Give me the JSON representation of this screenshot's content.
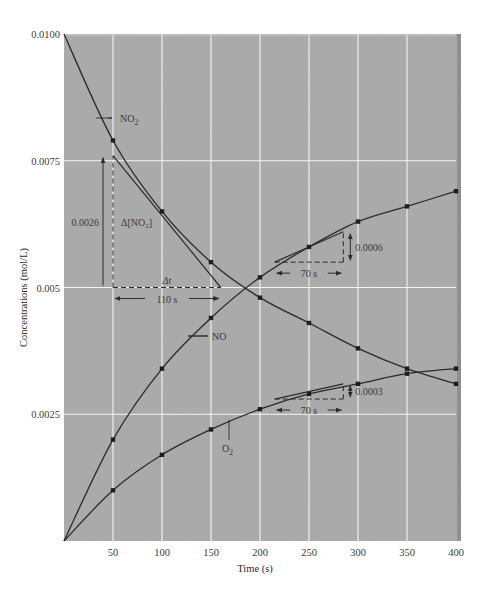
{
  "chart_data": {
    "type": "line",
    "title": "",
    "xlabel": "Time (s)",
    "ylabel": "Concentrations (mol/L)",
    "xlim": [
      0,
      400
    ],
    "ylim": [
      0,
      0.01
    ],
    "x_ticks": [
      50,
      100,
      150,
      200,
      250,
      300,
      350,
      400
    ],
    "x_tick_labels": [
      "50",
      "100",
      "150",
      "200",
      "250",
      "300",
      "350",
      "400"
    ],
    "y_ticks": [
      0.0025,
      0.005,
      0.0075,
      0.01
    ],
    "y_tick_labels": [
      "0.0025",
      "0.005",
      "0.0075",
      "0.0100"
    ],
    "grid": true,
    "legend": "inline labels",
    "x": [
      0,
      50,
      100,
      150,
      200,
      250,
      300,
      350,
      400
    ],
    "series": [
      {
        "name": "NO2",
        "label": "NO",
        "label_sub": "2",
        "values": [
          0.01,
          0.0079,
          0.0065,
          0.0055,
          0.0048,
          0.0043,
          0.0038,
          0.0034,
          0.0031
        ]
      },
      {
        "name": "NO",
        "label": "NO",
        "label_sub": "",
        "values": [
          0.0,
          0.002,
          0.0034,
          0.0044,
          0.0052,
          0.0058,
          0.0063,
          0.0066,
          0.0069
        ]
      },
      {
        "name": "O2",
        "label": "O",
        "label_sub": "2",
        "values": [
          0.0,
          0.001,
          0.0017,
          0.0022,
          0.0026,
          0.0029,
          0.0031,
          0.0033,
          0.0034
        ]
      }
    ],
    "annotations": [
      {
        "type": "tangent",
        "series": "NO2",
        "from": [
          50,
          0.0076
        ],
        "to": [
          160,
          0.005
        ]
      },
      {
        "type": "delta_y",
        "text": "0.0026",
        "label": "Δ[NO₂]",
        "x": 50,
        "y_from": 0.005,
        "y_to": 0.0076
      },
      {
        "type": "delta_x",
        "text": "110 s",
        "label": "Δt",
        "y": 0.005,
        "x_from": 50,
        "x_to": 160
      },
      {
        "type": "tangent",
        "series": "NO",
        "from": [
          215,
          0.0055
        ],
        "to": [
          285,
          0.0061
        ]
      },
      {
        "type": "delta_y",
        "text": "0.0006",
        "x": 285,
        "y_from": 0.0055,
        "y_to": 0.0061
      },
      {
        "type": "delta_x",
        "text": "70 s",
        "y": 0.0055,
        "x_from": 215,
        "x_to": 285
      },
      {
        "type": "tangent",
        "series": "O2",
        "from": [
          215,
          0.0028
        ],
        "to": [
          285,
          0.0031
        ]
      },
      {
        "type": "delta_y",
        "text": "0.0003",
        "x": 285,
        "y_from": 0.0028,
        "y_to": 0.0031
      },
      {
        "type": "delta_x",
        "text": "70 s",
        "y": 0.0028,
        "x_from": 215,
        "x_to": 285
      }
    ]
  },
  "colors": {
    "plot_background": "#a9a9a9",
    "grid": "#f4f4f4",
    "curve": "#2b2b2b",
    "text": "#333333"
  }
}
